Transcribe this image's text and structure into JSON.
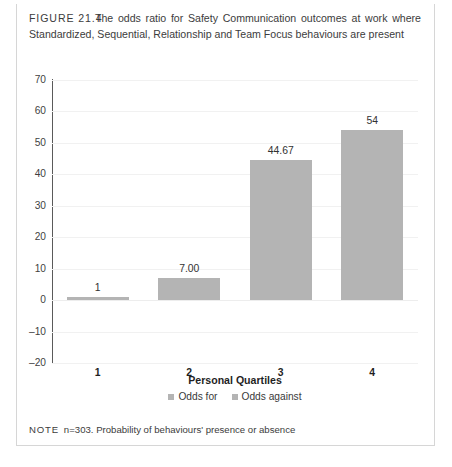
{
  "caption": {
    "label": "FIGURE 21.4",
    "text": "The odds ratio for Safety Communication outcomes at work where Standardized, Sequential, Relationship and Team Focus behaviours are present"
  },
  "note": {
    "label": "NOTE",
    "text": "n=303. Probability of behaviours' presence or absence"
  },
  "colors": {
    "bar": "#b4b4b4",
    "axis": "#5a5a5a",
    "grid": "#f1f1f1",
    "frame": "#d6d6d6",
    "text": "#3c3c3c"
  },
  "chart_data": {
    "type": "bar",
    "title": "",
    "xlabel": "Personal Quartiles",
    "ylabel": "",
    "categories": [
      "1",
      "2",
      "3",
      "4"
    ],
    "values": [
      1,
      7.0,
      44.67,
      54
    ],
    "value_labels": [
      "1",
      "7.00",
      "44.67",
      "54"
    ],
    "ylim": [
      -20,
      70
    ],
    "yticks": [
      70,
      60,
      50,
      40,
      30,
      20,
      10,
      0,
      -10,
      -20
    ],
    "ytick_labels": [
      "70",
      "60",
      "50",
      "40",
      "30",
      "20",
      "10",
      "0",
      "–10",
      "–20"
    ],
    "grid": true,
    "legend_position": "bottom",
    "legend": [
      {
        "label": "Odds for",
        "color": "#b4b4b4"
      },
      {
        "label": "Odds against",
        "color": "#b4b4b4"
      }
    ]
  }
}
